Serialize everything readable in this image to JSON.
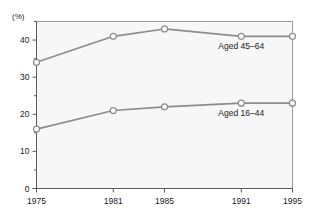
{
  "chart_data": {
    "type": "line",
    "title": "",
    "subtitle": "",
    "xlabel": "",
    "ylabel": "(%)",
    "unit_label": "(%)",
    "categories": [
      "1975",
      "1981",
      "1985",
      "1991",
      "1995"
    ],
    "x": [
      1975,
      1981,
      1985,
      1991,
      1995
    ],
    "xlim": [
      1975,
      1995
    ],
    "ylim": [
      0,
      45
    ],
    "y_ticks": [
      0,
      10,
      20,
      30,
      40
    ],
    "y_tick_labels": [
      "0",
      "10",
      "20",
      "30",
      "40"
    ],
    "y_minor_ticks": [
      5,
      15,
      25,
      35,
      45
    ],
    "x_tick_labels": [
      "1975",
      "1981",
      "1985",
      "1991",
      "1995"
    ],
    "grid": false,
    "legend_position": "inline-right",
    "series": [
      {
        "name": "Aged 45–64",
        "label": "Aged 45–64",
        "values": [
          34,
          41,
          43,
          41,
          41
        ],
        "color": "#8c8c8c",
        "marker": "open-circle",
        "label_x": 1991,
        "label_y": 37.5
      },
      {
        "name": "Aged 16–44",
        "label": "Aged 16–44",
        "values": [
          16,
          21,
          22,
          23,
          23
        ],
        "color": "#8c8c8c",
        "marker": "open-circle",
        "label_x": 1991,
        "label_y": 19.5
      }
    ]
  },
  "colors": {
    "line": "#8c8c8c",
    "marker_stroke": "#8c8c8c",
    "marker_fill": "#ffffff",
    "axis": "#5a5a5a",
    "frame": "#9a9a9a",
    "plot_background": "#f7f7f7",
    "page_background": "#ffffff",
    "text": "#1a1a1a"
  }
}
